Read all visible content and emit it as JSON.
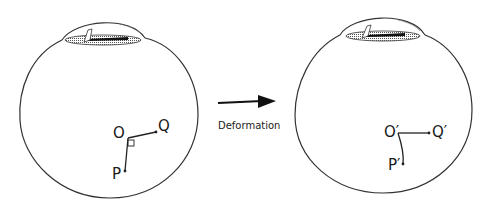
{
  "figure": {
    "caption_arrow": "Deformation",
    "colors": {
      "stroke": "#333333",
      "cornea_fill": "#888888",
      "pupil": "#111111"
    }
  },
  "left_eye": {
    "label": "Undeformed eye",
    "points": {
      "O": "O",
      "Q": "Q",
      "P": "P"
    },
    "right_angle_marker": true
  },
  "right_eye": {
    "label": "Deformed eye",
    "points": {
      "O": "O′",
      "Q": "Q′",
      "P": "P′"
    }
  }
}
